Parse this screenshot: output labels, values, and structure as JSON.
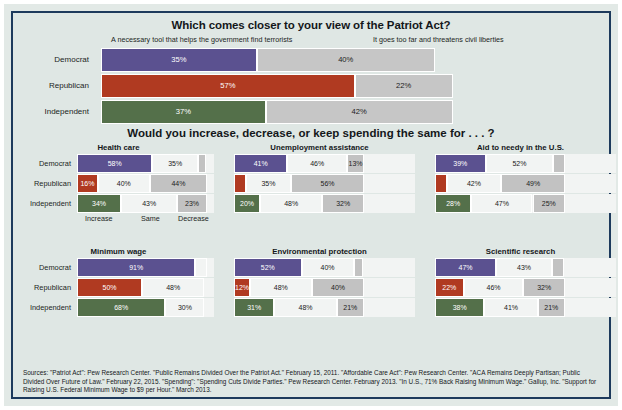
{
  "chart_data": [
    {
      "type": "bar",
      "title": "Which comes closer to your view of the Patriot Act?",
      "orientation": "horizontal",
      "stacked": true,
      "grid": false,
      "legend_position": "top",
      "xlabel": "",
      "ylabel": "",
      "xlim": [
        0,
        100
      ],
      "legend": [
        "A necessary tool that helps the government find terrorists",
        "It goes too far and threatens civil liberties"
      ],
      "categories": [
        "Democrat",
        "Republican",
        "Independent"
      ],
      "series": [
        {
          "name": "A necessary tool that helps the government find terrorists",
          "values": [
            35,
            57,
            37
          ],
          "color": "#5b5190"
        },
        {
          "name": "It goes too far and threatens civil liberties",
          "values": [
            40,
            22,
            42
          ],
          "color": "#c6c6c6"
        }
      ],
      "rows": [
        {
          "label": "Democrat",
          "party": "dem",
          "segments": [
            {
              "kind": "party",
              "value": 35,
              "label": "35%"
            },
            {
              "kind": "grey",
              "value": 40,
              "label": "40%"
            }
          ]
        },
        {
          "label": "Republican",
          "party": "rep",
          "segments": [
            {
              "kind": "party",
              "value": 57,
              "label": "57%"
            },
            {
              "kind": "grey",
              "value": 22,
              "label": "22%"
            }
          ]
        },
        {
          "label": "Independent",
          "party": "ind",
          "segments": [
            {
              "kind": "party",
              "value": 37,
              "label": "37%"
            },
            {
              "kind": "grey",
              "value": 42,
              "label": "42%"
            }
          ]
        }
      ]
    },
    {
      "type": "bar",
      "title": "Would you increase, decrease, or keep spending the same for . . . ?",
      "orientation": "horizontal",
      "stacked": true,
      "grid": false,
      "axis_labels": [
        "Increase",
        "Same",
        "Decrease"
      ],
      "categories": [
        "Democrat",
        "Republican",
        "Independent"
      ],
      "panels": [
        {
          "title": "Health care",
          "rows": [
            {
              "label": "Democrat",
              "party": "dem",
              "segments": [
                {
                  "kind": "party",
                  "value": 58,
                  "label": "58%"
                },
                {
                  "kind": "white",
                  "value": 35,
                  "label": "35%"
                },
                {
                  "kind": "grey",
                  "value": 6,
                  "label": ""
                }
              ]
            },
            {
              "label": "Republican",
              "party": "rep",
              "segments": [
                {
                  "kind": "party",
                  "value": 16,
                  "label": "16%"
                },
                {
                  "kind": "white",
                  "value": 40,
                  "label": "40%"
                },
                {
                  "kind": "grey",
                  "value": 44,
                  "label": "44%"
                }
              ]
            },
            {
              "label": "Independent",
              "party": "ind",
              "segments": [
                {
                  "kind": "party",
                  "value": 34,
                  "label": "34%"
                },
                {
                  "kind": "white",
                  "value": 43,
                  "label": "43%"
                },
                {
                  "kind": "grey",
                  "value": 23,
                  "label": "23%"
                }
              ]
            }
          ]
        },
        {
          "title": "Unemployment assistance",
          "rows": [
            {
              "label": "Democrat",
              "party": "dem",
              "segments": [
                {
                  "kind": "party",
                  "value": 41,
                  "label": "41%"
                },
                {
                  "kind": "white",
                  "value": 46,
                  "label": "46%"
                },
                {
                  "kind": "grey",
                  "value": 13,
                  "label": "13%"
                }
              ]
            },
            {
              "label": "Republican",
              "party": "rep",
              "segments": [
                {
                  "kind": "party",
                  "value": 9,
                  "label": ""
                },
                {
                  "kind": "white",
                  "value": 35,
                  "label": "35%"
                },
                {
                  "kind": "grey",
                  "value": 56,
                  "label": "56%"
                }
              ]
            },
            {
              "label": "Independent",
              "party": "ind",
              "segments": [
                {
                  "kind": "party",
                  "value": 20,
                  "label": "20%"
                },
                {
                  "kind": "white",
                  "value": 48,
                  "label": "48%"
                },
                {
                  "kind": "grey",
                  "value": 32,
                  "label": "32%"
                }
              ]
            }
          ]
        },
        {
          "title": "Aid to needy in the U.S.",
          "rows": [
            {
              "label": "Democrat",
              "party": "dem",
              "segments": [
                {
                  "kind": "party",
                  "value": 39,
                  "label": "39%"
                },
                {
                  "kind": "white",
                  "value": 52,
                  "label": "52%"
                },
                {
                  "kind": "grey",
                  "value": 9,
                  "label": ""
                }
              ]
            },
            {
              "label": "Republican",
              "party": "rep",
              "segments": [
                {
                  "kind": "party",
                  "value": 9,
                  "label": ""
                },
                {
                  "kind": "white",
                  "value": 42,
                  "label": "42%"
                },
                {
                  "kind": "grey",
                  "value": 49,
                  "label": "49%"
                }
              ]
            },
            {
              "label": "Independent",
              "party": "ind",
              "segments": [
                {
                  "kind": "party",
                  "value": 28,
                  "label": "28%"
                },
                {
                  "kind": "white",
                  "value": 47,
                  "label": "47%"
                },
                {
                  "kind": "grey",
                  "value": 25,
                  "label": "25%"
                }
              ]
            }
          ]
        },
        {
          "title": "Minimum wage",
          "rows": [
            {
              "label": "Democrat",
              "party": "dem",
              "segments": [
                {
                  "kind": "party",
                  "value": 91,
                  "label": "91%"
                },
                {
                  "kind": "white",
                  "value": 9,
                  "label": ""
                }
              ]
            },
            {
              "label": "Republican",
              "party": "rep",
              "segments": [
                {
                  "kind": "party",
                  "value": 50,
                  "label": "50%"
                },
                {
                  "kind": "white",
                  "value": 48,
                  "label": "48%"
                }
              ]
            },
            {
              "label": "Independent",
              "party": "ind",
              "segments": [
                {
                  "kind": "party",
                  "value": 68,
                  "label": "68%"
                },
                {
                  "kind": "white",
                  "value": 30,
                  "label": "30%"
                }
              ]
            }
          ]
        },
        {
          "title": "Environmental protection",
          "rows": [
            {
              "label": "Democrat",
              "party": "dem",
              "segments": [
                {
                  "kind": "party",
                  "value": 52,
                  "label": "52%"
                },
                {
                  "kind": "white",
                  "value": 40,
                  "label": "40%"
                },
                {
                  "kind": "grey",
                  "value": 7,
                  "label": ""
                }
              ]
            },
            {
              "label": "Republican",
              "party": "rep",
              "segments": [
                {
                  "kind": "party",
                  "value": 12,
                  "label": "12%"
                },
                {
                  "kind": "white",
                  "value": 48,
                  "label": "48%"
                },
                {
                  "kind": "grey",
                  "value": 40,
                  "label": "40%"
                }
              ]
            },
            {
              "label": "Independent",
              "party": "ind",
              "segments": [
                {
                  "kind": "party",
                  "value": 31,
                  "label": "31%"
                },
                {
                  "kind": "white",
                  "value": 48,
                  "label": "48%"
                },
                {
                  "kind": "grey",
                  "value": 21,
                  "label": "21%"
                }
              ]
            }
          ]
        },
        {
          "title": "Scientific research",
          "rows": [
            {
              "label": "Democrat",
              "party": "dem",
              "segments": [
                {
                  "kind": "party",
                  "value": 47,
                  "label": "47%"
                },
                {
                  "kind": "white",
                  "value": 43,
                  "label": "43%"
                },
                {
                  "kind": "grey",
                  "value": 9,
                  "label": ""
                }
              ]
            },
            {
              "label": "Republican",
              "party": "rep",
              "segments": [
                {
                  "kind": "party",
                  "value": 22,
                  "label": "22%"
                },
                {
                  "kind": "white",
                  "value": 46,
                  "label": "46%"
                },
                {
                  "kind": "grey",
                  "value": 32,
                  "label": "32%"
                }
              ]
            },
            {
              "label": "Independent",
              "party": "ind",
              "segments": [
                {
                  "kind": "party",
                  "value": 38,
                  "label": "38%"
                },
                {
                  "kind": "white",
                  "value": 41,
                  "label": "41%"
                },
                {
                  "kind": "grey",
                  "value": 21,
                  "label": "21%"
                }
              ]
            }
          ]
        }
      ]
    }
  ],
  "patriot": {
    "title": "Which comes closer to your view of the Patriot Act?",
    "legend_left": "A necessary tool that helps the government find terrorists",
    "legend_right": "It goes too far and threatens civil liberties"
  },
  "spending": {
    "title": "Would you increase, decrease, or keep spending the same for . . . ?",
    "axis": {
      "increase": "Increase",
      "same": "Same",
      "decrease": "Decrease"
    }
  },
  "sources": {
    "text": "Sources: \"Patriot Act\": Pew Research Center. \"Public Remains Divided Over the Patriot Act.\" February 15, 2011. \"Affordable Care Act\": Pew Research Center. \"ACA Remains Deeply Partisan; Public Divided Over Future of Law.\" February 22, 2015. \"Spending\": \"Spending Cuts Divide Parties.\" Pew Research Center. February 2013. \"In U.S., 71% Back Raising Minimum Wage.\" Gallup, Inc. \"Support for Raising U.S. Federal Minimum Wage to $9 per Hour.\" March 2013."
  },
  "colors": {
    "democrat": "#5b5190",
    "republican": "#b03a21",
    "independent": "#54704a",
    "grey": "#c2c2c2",
    "white_seg": "#f2f4f3",
    "background": "#dfe7e4",
    "border": "#1d3a5c"
  }
}
